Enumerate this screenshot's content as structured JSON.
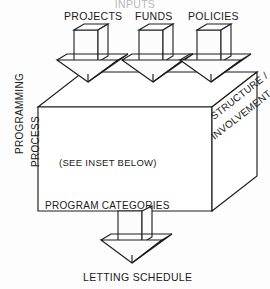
{
  "diagram": {
    "title_clipped": "INPUTS",
    "inputs": [
      {
        "id": "projects",
        "label": "PROJECTS"
      },
      {
        "id": "funds",
        "label": "FUNDS"
      },
      {
        "id": "policies",
        "label": "POLICIES"
      }
    ],
    "left_axis": {
      "line1": "PROGRAMMING",
      "line2": "PROCESS"
    },
    "right_face": {
      "line1": "STRUCTURE /",
      "line2": "INVOLVEMENT"
    },
    "front_face": {
      "inset_note": "(SEE INSET BELOW)",
      "bottom_label": "PROGRAM CATEGORIES"
    },
    "output": {
      "label": "LETTING SCHEDULE"
    },
    "colors": {
      "ink": "#1c1c1c",
      "paper": "#fdfdfd",
      "face_fill": "#ffffff"
    }
  }
}
